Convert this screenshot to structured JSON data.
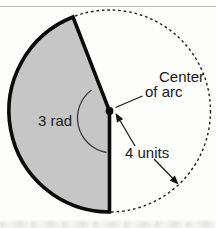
{
  "figure": {
    "labels": {
      "angle": "3 rad",
      "center_line1": "Center",
      "center_line2": "of arc",
      "radius": "4 units"
    },
    "colors": {
      "sector_fill": "#c6c6c6",
      "line": "#0f0f0f",
      "top_rule": "#b6b6b6"
    }
  }
}
